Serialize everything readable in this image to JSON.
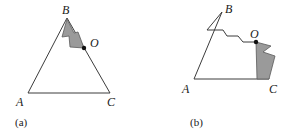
{
  "figure": {
    "background_color": "#ffffff",
    "stroke_color": "#3c3c3c",
    "fill_color": "#9a9a9a",
    "label_color": "#1a1a1a",
    "panels": [
      {
        "id": "a",
        "caption": "(a)",
        "caption_x": 15,
        "caption_y": 117,
        "shape_name": "triangle",
        "outline_points": "67,18 28,93 110,93",
        "shaded_points": "67,19 62,37 69,36 70,47 84,48 78,32 74,33",
        "marker": {
          "label": "O",
          "x": 84,
          "y": 48,
          "label_x": 90,
          "label_y": 37
        },
        "vertices": [
          {
            "name": "B",
            "x": 67,
            "y": 18,
            "label_x": 62,
            "label_y": 4
          },
          {
            "name": "A",
            "x": 28,
            "y": 93,
            "label_x": 16,
            "label_y": 96
          },
          {
            "name": "C",
            "x": 110,
            "y": 93,
            "label_x": 107,
            "label_y": 96
          }
        ]
      },
      {
        "id": "b",
        "caption": "(b)",
        "caption_x": 190,
        "caption_y": 117,
        "shape_name": "triangle-deformed",
        "outline_points": "73,12 45,79 120,79 108,42 94,42 89,36 78,36 74,30 58,30",
        "shaded_points": "107,42 122,46 114,52 126,56 120,79 108,79",
        "marker": {
          "label": "O",
          "x": 107,
          "y": 42,
          "label_x": 101,
          "label_y": 28
        },
        "vertices": [
          {
            "name": "B",
            "x": 73,
            "y": 12,
            "label_x": 76,
            "label_y": 3
          },
          {
            "name": "A",
            "x": 45,
            "y": 79,
            "label_x": 33,
            "label_y": 83
          },
          {
            "name": "C",
            "x": 120,
            "y": 79,
            "label_x": 120,
            "label_y": 83
          }
        ]
      }
    ]
  }
}
